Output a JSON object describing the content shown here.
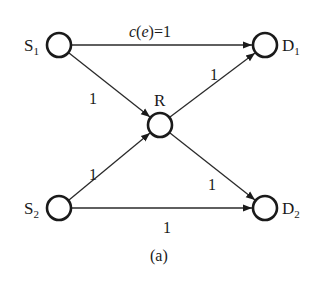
{
  "diagram": {
    "type": "network-coding-graph",
    "caption": "(a)",
    "colors": {
      "stroke": "#1a1a1a",
      "background": "#ffffff"
    },
    "nodes": [
      {
        "id": "S1",
        "label": "S",
        "subscript": "1",
        "x": 59,
        "y": 45
      },
      {
        "id": "D1",
        "label": "D",
        "subscript": "1",
        "x": 265,
        "y": 45
      },
      {
        "id": "R",
        "label": "R",
        "subscript": "",
        "x": 160,
        "y": 125
      },
      {
        "id": "S2",
        "label": "S",
        "subscript": "2",
        "x": 59,
        "y": 208
      },
      {
        "id": "D2",
        "label": "D",
        "subscript": "2",
        "x": 265,
        "y": 208
      }
    ],
    "edges": [
      {
        "from": "S1",
        "to": "D1",
        "label": "c(e)=1",
        "label_c": "c",
        "label_rest": "(",
        "label_e": "e",
        "label_tail": ")=1"
      },
      {
        "from": "S1",
        "to": "R",
        "label": "1"
      },
      {
        "from": "S2",
        "to": "R",
        "label": "1"
      },
      {
        "from": "R",
        "to": "D1",
        "label": "1"
      },
      {
        "from": "R",
        "to": "D2",
        "label": "1"
      },
      {
        "from": "S2",
        "to": "D2",
        "label": "1"
      }
    ]
  }
}
